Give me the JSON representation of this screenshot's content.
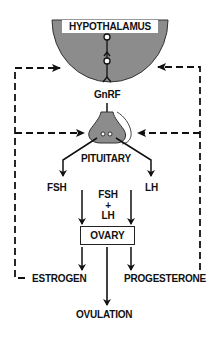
{
  "diagram": {
    "nodes": {
      "hypothalamus": "HYPOTHALAMUS",
      "gnrf": "GnRF",
      "pituitary": "PITUITARY",
      "fsh": "FSH",
      "lh": "LH",
      "fsh_lh_top": "FSH",
      "fsh_lh_plus": "+",
      "fsh_lh_bottom": "LH",
      "ovary": "OVARY",
      "estrogen": "ESTROGEN",
      "progesterone": "PROGESTERONE",
      "ovulation": "OVULATION"
    },
    "edges": [
      {
        "from": "HYPOTHALAMUS",
        "to": "PITUITARY",
        "label": "GnRF",
        "style": "solid"
      },
      {
        "from": "PITUITARY",
        "to": "FSH",
        "style": "solid"
      },
      {
        "from": "PITUITARY",
        "to": "LH",
        "style": "solid"
      },
      {
        "from": "FSH",
        "to": "OVARY",
        "style": "solid"
      },
      {
        "from": "LH",
        "to": "OVARY",
        "style": "solid"
      },
      {
        "from": "OVARY",
        "to": "ESTROGEN",
        "style": "solid"
      },
      {
        "from": "OVARY",
        "to": "PROGESTERONE",
        "style": "solid"
      },
      {
        "from": "OVARY",
        "to": "OVULATION",
        "style": "solid"
      },
      {
        "from": "ESTROGEN",
        "to": "HYPOTHALAMUS",
        "style": "dashed",
        "type": "feedback"
      },
      {
        "from": "ESTROGEN",
        "to": "PITUITARY",
        "style": "dashed",
        "type": "feedback"
      },
      {
        "from": "PROGESTERONE",
        "to": "HYPOTHALAMUS",
        "style": "dashed",
        "type": "feedback"
      },
      {
        "from": "PROGESTERONE",
        "to": "PITUITARY",
        "style": "dashed",
        "type": "feedback"
      }
    ],
    "colors": {
      "gland_fill": "#8c8c8c",
      "line": "#111111",
      "background": "#ffffff"
    }
  }
}
